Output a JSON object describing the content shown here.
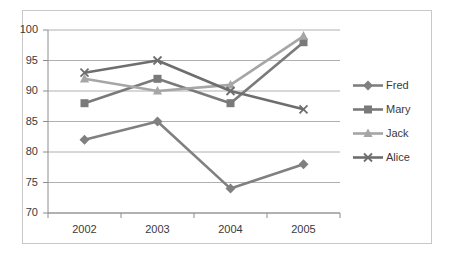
{
  "chart_data": {
    "type": "line",
    "title": "",
    "xlabel": "",
    "ylabel": "",
    "categories": [
      "2002",
      "2003",
      "2004",
      "2005"
    ],
    "ylim": [
      70,
      100
    ],
    "yticks": [
      70,
      75,
      80,
      85,
      90,
      95,
      100
    ],
    "grid": true,
    "legend_position": "right",
    "series": [
      {
        "name": "Fred",
        "values": [
          82,
          85,
          74,
          78
        ],
        "color": "#808080",
        "marker": "diamond"
      },
      {
        "name": "Mary",
        "values": [
          88,
          92,
          88,
          98
        ],
        "color": "#7a7a7a",
        "marker": "square"
      },
      {
        "name": "Jack",
        "values": [
          92,
          90,
          91,
          99
        ],
        "color": "#a6a6a6",
        "marker": "triangle"
      },
      {
        "name": "Alice",
        "values": [
          93,
          95,
          90,
          87
        ],
        "color": "#6e6e6e",
        "marker": "cross"
      }
    ]
  },
  "axis": {
    "ytick_labels": [
      "100",
      "95",
      "90",
      "85",
      "80",
      "75",
      "70"
    ],
    "xtick_labels": [
      "2002",
      "2003",
      "2004",
      "2005"
    ]
  },
  "legend": {
    "items": [
      {
        "label": "Fred"
      },
      {
        "label": "Mary"
      },
      {
        "label": "Jack"
      },
      {
        "label": "Alice"
      }
    ]
  },
  "colors": {
    "gridline": "#b0b0b0",
    "axis": "#8c8c8c",
    "border": "#c8c8c8",
    "text": "#3a3a3a"
  }
}
